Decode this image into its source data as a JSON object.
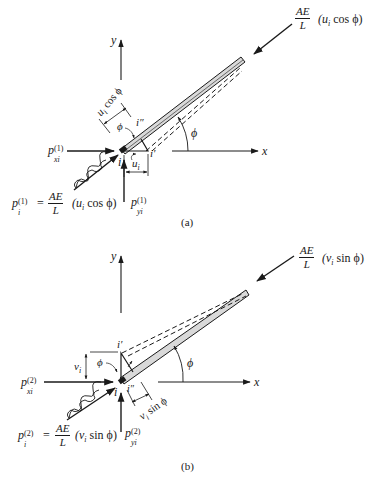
{
  "figure": {
    "colors": {
      "ink": "#1a1a1a",
      "bar_fill": "#d9d9d9",
      "background": "#ffffff"
    },
    "panels": [
      {
        "id": "a",
        "caption": "(a)",
        "axes": {
          "x_label": "x",
          "y_label": "y"
        },
        "angle_label": "ϕ",
        "node_labels": {
          "i": "i",
          "i_prime": "i′",
          "i_double_prime": "i″"
        },
        "displacement": {
          "symbol": "u",
          "subscript": "i"
        },
        "projected_displacement": {
          "text": "u",
          "subscript": "i",
          "suffix": " cos ϕ"
        },
        "inner_angle_label": "ϕ",
        "end_force": {
          "num": "AE",
          "den": "L",
          "expr_prefix": "(u",
          "expr_sub": "i",
          "expr_suffix": " cos ϕ)"
        },
        "horizontal_force": {
          "symbol": "p",
          "superscript": "(1)",
          "subscript": "xi"
        },
        "vertical_force": {
          "symbol": "p",
          "superscript": "(1)",
          "subscript": "yi"
        },
        "axial_force_equation": {
          "lhs_symbol": "p",
          "lhs_sub": "i",
          "lhs_sup": "(1)",
          "equals": "=",
          "num": "AE",
          "den": "L",
          "expr_prefix": "(u",
          "expr_sub": "i",
          "expr_suffix": " cos ϕ)"
        }
      },
      {
        "id": "b",
        "caption": "(b)",
        "axes": {
          "x_label": "x",
          "y_label": "y"
        },
        "angle_label": "ϕ",
        "node_labels": {
          "i": "i",
          "i_prime": "i′",
          "i_double_prime": "i″"
        },
        "displacement": {
          "symbol": "v",
          "subscript": "i"
        },
        "projected_displacement": {
          "text": "v",
          "subscript": "i",
          "suffix": " sin ϕ"
        },
        "inner_angle_label": "ϕ",
        "end_force": {
          "num": "AE",
          "den": "L",
          "expr_prefix": "(v",
          "expr_sub": "i",
          "expr_suffix": " sin ϕ)"
        },
        "horizontal_force": {
          "symbol": "p",
          "superscript": "(2)",
          "subscript": "xi"
        },
        "vertical_force": {
          "symbol": "p",
          "superscript": "(2)",
          "subscript": "yi"
        },
        "axial_force_equation": {
          "lhs_symbol": "p",
          "lhs_sub": "i",
          "lhs_sup": "(2)",
          "equals": "=",
          "num": "AE",
          "den": "L",
          "expr_prefix": "(v",
          "expr_sub": "i",
          "expr_suffix": " sin ϕ)"
        }
      }
    ]
  }
}
